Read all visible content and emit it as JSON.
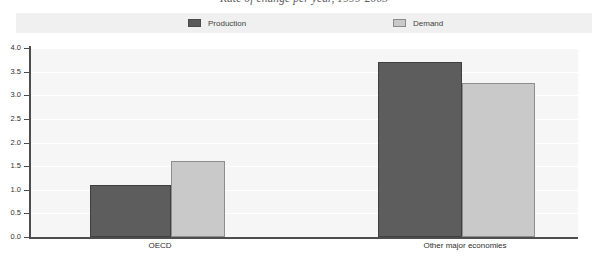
{
  "chart_data": {
    "type": "bar",
    "title": "Rate of change per year, 1999-2005",
    "xlabel": "",
    "ylabel": "",
    "categories": [
      "OECD",
      "Other major economies"
    ],
    "series": [
      {
        "name": "Production",
        "color": "#5d5d5d",
        "values": [
          1.1,
          3.7
        ]
      },
      {
        "name": "Demand",
        "color": "#c9c9c9",
        "values": [
          1.6,
          3.25
        ]
      }
    ],
    "ylim": [
      0.0,
      4.0
    ],
    "ytick_step": 0.5,
    "ytick_labels": [
      "0.0",
      "0.5",
      "1.0",
      "1.5",
      "2.0",
      "2.5",
      "3.0",
      "3.5",
      "4.0"
    ],
    "grid": true,
    "grid_axis": "y",
    "legend_position": "top",
    "plot_background": "#f6f6f6",
    "gridline_color": "#ffffff",
    "axis_color": "#4d4d4d"
  },
  "legend": {
    "entries": [
      {
        "label": "Production",
        "swatch": "production-swatch"
      },
      {
        "label": "Demand",
        "swatch": "demand-swatch"
      }
    ]
  }
}
